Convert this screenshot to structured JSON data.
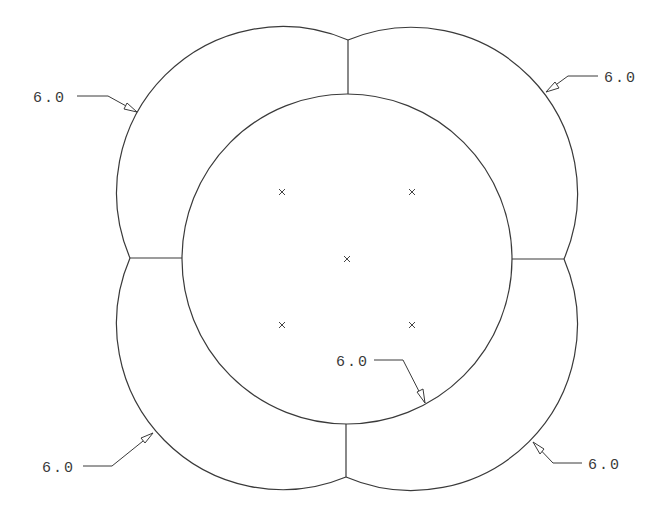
{
  "drawing": {
    "type": "technical-drawing",
    "description": "Four-lobed clover outline surrounding a central circle with dimension leaders",
    "line_color": "#3a3a3a",
    "background": "#ffffff",
    "inner_circle": {
      "cx": 347,
      "cy": 259,
      "r": 165
    },
    "lobes": [
      {
        "name": "top-left",
        "cx": 282,
        "cy": 192,
        "r": 166
      },
      {
        "name": "top-right",
        "cx": 412,
        "cy": 192,
        "r": 166
      },
      {
        "name": "bottom-left",
        "cx": 282,
        "cy": 325,
        "r": 166
      },
      {
        "name": "bottom-right",
        "cx": 412,
        "cy": 325,
        "r": 166
      }
    ],
    "center_marks": [
      {
        "x": 282,
        "y": 192
      },
      {
        "x": 412,
        "y": 192
      },
      {
        "x": 347,
        "y": 259
      },
      {
        "x": 282,
        "y": 325
      },
      {
        "x": 412,
        "y": 325
      }
    ],
    "dimensions": [
      {
        "label": "6.0",
        "position": "top-left"
      },
      {
        "label": "6.0",
        "position": "top-right"
      },
      {
        "label": "6.0",
        "position": "center"
      },
      {
        "label": "6.0",
        "position": "bottom-left"
      },
      {
        "label": "6.0",
        "position": "bottom-right"
      }
    ]
  }
}
